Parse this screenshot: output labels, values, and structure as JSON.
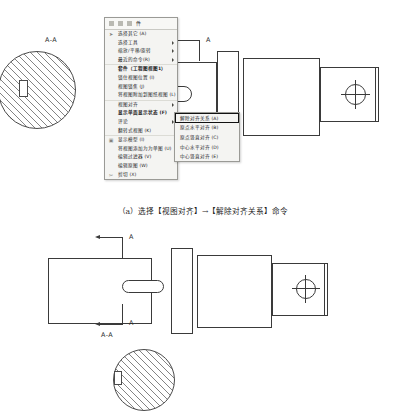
{
  "menu": {
    "header": {
      "icons": [
        "cut-icon",
        "copy-icon",
        "paste-icon"
      ],
      "title": "件"
    },
    "items": [
      {
        "label": "选择其它 (A)",
        "icon": "pointer-icon",
        "submenu": false,
        "bold": false
      },
      {
        "label": "选择工具",
        "icon": "",
        "submenu": true,
        "bold": false
      },
      {
        "label": "缩放/平移/旋转",
        "icon": "",
        "submenu": true,
        "bold": false
      },
      {
        "label": "最近的命令(R)",
        "icon": "",
        "submenu": true,
        "bold": false
      },
      {
        "label": "套件（工程图视图1）",
        "icon": "",
        "submenu": false,
        "bold": true
      },
      {
        "label": "锁住视图位置 (I)",
        "icon": "",
        "submenu": false,
        "bold": false
      },
      {
        "label": "视图锁焦 (J)",
        "icon": "",
        "submenu": false,
        "bold": false
      },
      {
        "label": "将视图附加到图纸视图 (L)",
        "icon": "",
        "submenu": false,
        "bold": false
      },
      {
        "label": "视图对齐",
        "icon": "",
        "submenu": true,
        "bold": false
      },
      {
        "label": "显示单面显示状态 (F)",
        "icon": "",
        "submenu": false,
        "bold": true
      },
      {
        "label": "评论",
        "icon": "",
        "submenu": true,
        "bold": false
      },
      {
        "label": "翻转式视图 (K)",
        "icon": "",
        "submenu": false,
        "bold": false
      },
      {
        "label": "显示模型 (I)",
        "icon": "display-icon",
        "submenu": false,
        "bold": false
      },
      {
        "label": "将视图添加为为单图 (U)",
        "icon": "",
        "submenu": false,
        "bold": false
      },
      {
        "label": "编辑过滤器 (V)",
        "icon": "",
        "submenu": false,
        "bold": false
      },
      {
        "label": "编辑原图 (W)",
        "icon": "",
        "submenu": false,
        "bold": false
      },
      {
        "label": "剪切 (X)",
        "icon": "scissors-icon",
        "submenu": false,
        "bold": false
      }
    ],
    "submenu": {
      "title": "视图对齐",
      "items": [
        {
          "label": "解除对齐关系 (A)",
          "selected": true
        },
        {
          "label": "原点水平对齐 (B)",
          "selected": false
        },
        {
          "label": "原点竖直对齐 (C)",
          "selected": false
        },
        {
          "label": "中心水平对齐 (D)",
          "selected": false
        },
        {
          "label": "中心竖直对齐 (E)",
          "selected": false
        }
      ]
    }
  },
  "figure_a": {
    "section_label": "A-A",
    "view_arrow_label": "A",
    "caption": "（a）选择【视图对齐】→【解除对齐关系】命令"
  },
  "figure_b": {
    "arrow_label_top": "A",
    "arrow_label_bottom": "A",
    "section_label": "A-A"
  }
}
